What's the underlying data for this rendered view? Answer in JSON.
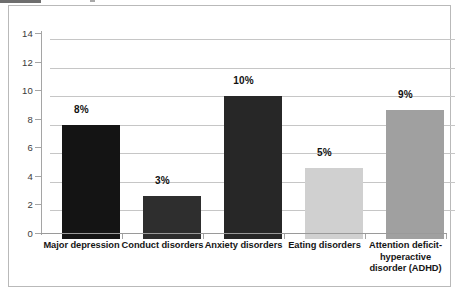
{
  "chart_data": {
    "type": "bar",
    "title": "",
    "subtitle": "",
    "xlabel": "",
    "ylabel": "",
    "ylim": [
      0,
      14
    ],
    "ytick_step": 2,
    "yticks": [
      "0",
      "2",
      "4",
      "6",
      "8",
      "10",
      "12",
      "14"
    ],
    "grid": true,
    "legend": false,
    "categories": [
      "Major depression",
      "Conduct disorders",
      "Anxiety disorders",
      "Eating disorders",
      "Attention deficit-hyperactive disorder (ADHD)"
    ],
    "values": [
      8,
      3,
      10,
      5,
      9
    ],
    "data_labels": [
      "8%",
      "3%",
      "10%",
      "5%",
      "9%"
    ],
    "bar_colors": [
      "#141414",
      "#2e2e2e",
      "#272727",
      "#d0d0d0",
      "#a0a0a0"
    ],
    "category_label_lines": [
      [
        "Major depression"
      ],
      [
        "Conduct disorders"
      ],
      [
        "Anxiety disorders"
      ],
      [
        "Eating disorders"
      ],
      [
        "Attention deficit-",
        "hyperactive",
        "disorder (ADHD)"
      ]
    ]
  },
  "style": {
    "gridline_color": "#c6c6c6",
    "axis_color": "#a5a5a5",
    "frame_color": "#b9b9b9",
    "plot_background": "#ffffff",
    "label_color": "#161616"
  }
}
